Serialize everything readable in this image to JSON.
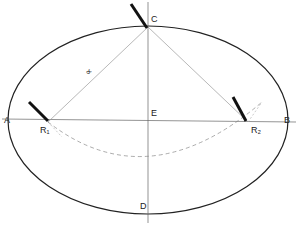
{
  "diagram": {
    "labels": {
      "A": "A",
      "B": "B",
      "C": "C",
      "D": "D",
      "E": "E",
      "R1": "R₁",
      "R2": "R₂",
      "angle": "∝"
    },
    "colors": {
      "outline": "#222222",
      "construction": "#999999",
      "dashed": "#888888"
    }
  }
}
